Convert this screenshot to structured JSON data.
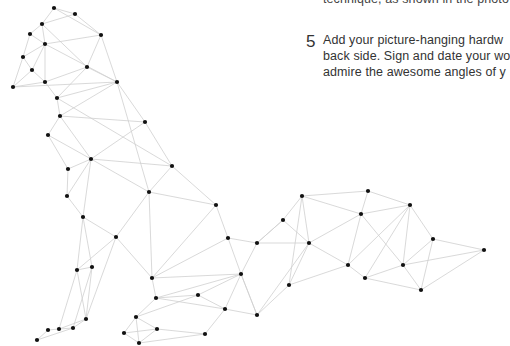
{
  "text": {
    "previous_line": "technique, as shown in the photo",
    "step": {
      "number": "5",
      "lines": [
        "Add your picture-hanging hardw",
        "back side. Sign and date your wo",
        "admire the awesome angles of y"
      ]
    }
  },
  "illustration": {
    "subject": "geometric wire-frame dog (sitting, tail extended)",
    "node_color": "#111111",
    "edge_color": "#cfcfcf",
    "nodes": [
      [
        54,
        8
      ],
      [
        75,
        14
      ],
      [
        42,
        24
      ],
      [
        30,
        34
      ],
      [
        45,
        44
      ],
      [
        101,
        35
      ],
      [
        23,
        57
      ],
      [
        32,
        70
      ],
      [
        45,
        82
      ],
      [
        13,
        87
      ],
      [
        87,
        67
      ],
      [
        117,
        82
      ],
      [
        57,
        98
      ],
      [
        60,
        116
      ],
      [
        145,
        122
      ],
      [
        48,
        135
      ],
      [
        91,
        159
      ],
      [
        172,
        166
      ],
      [
        68,
        169
      ],
      [
        149,
        192
      ],
      [
        67,
        196
      ],
      [
        83,
        217
      ],
      [
        216,
        205
      ],
      [
        116,
        237
      ],
      [
        228,
        238
      ],
      [
        257,
        243
      ],
      [
        152,
        278
      ],
      [
        241,
        274
      ],
      [
        77,
        270
      ],
      [
        92,
        267
      ],
      [
        86,
        319
      ],
      [
        48,
        330
      ],
      [
        59,
        329
      ],
      [
        73,
        328
      ],
      [
        37,
        340
      ],
      [
        156,
        298
      ],
      [
        198,
        295
      ],
      [
        225,
        309
      ],
      [
        136,
        317
      ],
      [
        124,
        333
      ],
      [
        157,
        329
      ],
      [
        205,
        334
      ],
      [
        139,
        343
      ],
      [
        257,
        315
      ],
      [
        283,
        220
      ],
      [
        302,
        196
      ],
      [
        368,
        191
      ],
      [
        361,
        214
      ],
      [
        410,
        205
      ],
      [
        309,
        243
      ],
      [
        289,
        285
      ],
      [
        348,
        265
      ],
      [
        365,
        278
      ],
      [
        403,
        265
      ],
      [
        433,
        239
      ],
      [
        421,
        290
      ],
      [
        484,
        250
      ]
    ],
    "edges": [
      [
        0,
        1
      ],
      [
        0,
        2
      ],
      [
        1,
        5
      ],
      [
        1,
        2
      ],
      [
        2,
        3
      ],
      [
        2,
        4
      ],
      [
        2,
        10
      ],
      [
        3,
        4
      ],
      [
        3,
        6
      ],
      [
        4,
        5
      ],
      [
        4,
        6
      ],
      [
        4,
        7
      ],
      [
        4,
        8
      ],
      [
        4,
        11
      ],
      [
        5,
        10
      ],
      [
        5,
        11
      ],
      [
        5,
        0
      ],
      [
        6,
        7
      ],
      [
        6,
        9
      ],
      [
        7,
        8
      ],
      [
        7,
        9
      ],
      [
        8,
        9
      ],
      [
        8,
        10
      ],
      [
        8,
        12
      ],
      [
        9,
        11
      ],
      [
        10,
        11
      ],
      [
        10,
        12
      ],
      [
        11,
        12
      ],
      [
        11,
        13
      ],
      [
        11,
        14
      ],
      [
        11,
        19
      ],
      [
        12,
        13
      ],
      [
        12,
        17
      ],
      [
        13,
        14
      ],
      [
        13,
        15
      ],
      [
        13,
        16
      ],
      [
        14,
        16
      ],
      [
        14,
        17
      ],
      [
        15,
        16
      ],
      [
        15,
        18
      ],
      [
        16,
        17
      ],
      [
        16,
        18
      ],
      [
        16,
        19
      ],
      [
        16,
        20
      ],
      [
        16,
        21
      ],
      [
        17,
        19
      ],
      [
        17,
        22
      ],
      [
        18,
        20
      ],
      [
        19,
        22
      ],
      [
        19,
        23
      ],
      [
        19,
        26
      ],
      [
        20,
        21
      ],
      [
        21,
        23
      ],
      [
        21,
        28
      ],
      [
        21,
        29
      ],
      [
        22,
        24
      ],
      [
        22,
        26
      ],
      [
        23,
        26
      ],
      [
        23,
        28
      ],
      [
        23,
        30
      ],
      [
        24,
        26
      ],
      [
        24,
        27
      ],
      [
        24,
        25
      ],
      [
        25,
        27
      ],
      [
        25,
        44
      ],
      [
        25,
        49
      ],
      [
        26,
        27
      ],
      [
        26,
        35
      ],
      [
        27,
        35
      ],
      [
        27,
        36
      ],
      [
        27,
        37
      ],
      [
        27,
        43
      ],
      [
        28,
        29
      ],
      [
        28,
        30
      ],
      [
        28,
        32
      ],
      [
        29,
        30
      ],
      [
        29,
        33
      ],
      [
        30,
        33
      ],
      [
        30,
        32
      ],
      [
        31,
        32
      ],
      [
        31,
        34
      ],
      [
        32,
        33
      ],
      [
        34,
        33
      ],
      [
        35,
        36
      ],
      [
        35,
        38
      ],
      [
        35,
        37
      ],
      [
        36,
        37
      ],
      [
        36,
        38
      ],
      [
        37,
        41
      ],
      [
        37,
        43
      ],
      [
        38,
        39
      ],
      [
        38,
        40
      ],
      [
        38,
        42
      ],
      [
        39,
        40
      ],
      [
        39,
        42
      ],
      [
        40,
        41
      ],
      [
        40,
        42
      ],
      [
        41,
        42
      ],
      [
        43,
        49
      ],
      [
        43,
        27
      ],
      [
        44,
        45
      ],
      [
        44,
        49
      ],
      [
        44,
        25
      ],
      [
        45,
        46
      ],
      [
        45,
        47
      ],
      [
        45,
        50
      ],
      [
        46,
        47
      ],
      [
        46,
        48
      ],
      [
        47,
        48
      ],
      [
        47,
        49
      ],
      [
        47,
        51
      ],
      [
        47,
        53
      ],
      [
        48,
        51
      ],
      [
        48,
        52
      ],
      [
        48,
        53
      ],
      [
        48,
        54
      ],
      [
        49,
        50
      ],
      [
        49,
        51
      ],
      [
        50,
        51
      ],
      [
        50,
        43
      ],
      [
        51,
        52
      ],
      [
        52,
        53
      ],
      [
        52,
        55
      ],
      [
        53,
        54
      ],
      [
        53,
        55
      ],
      [
        53,
        56
      ],
      [
        54,
        55
      ],
      [
        54,
        56
      ],
      [
        55,
        56
      ],
      [
        45,
        49
      ]
    ]
  }
}
